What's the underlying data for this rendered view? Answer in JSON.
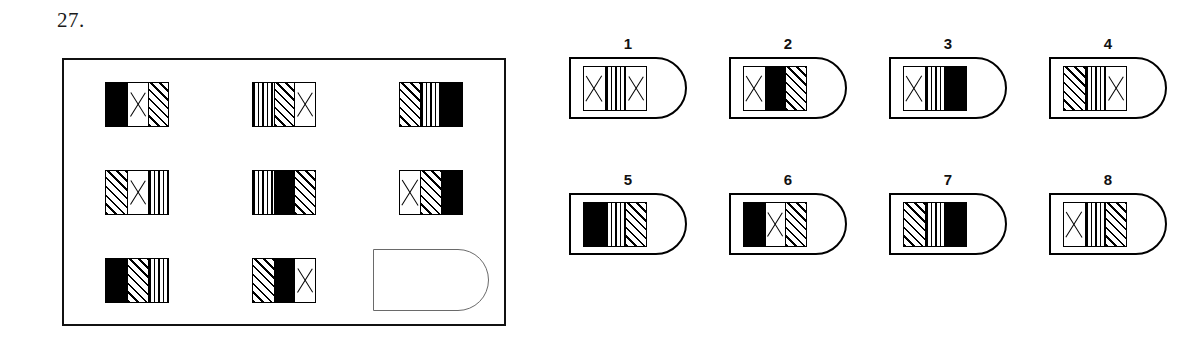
{
  "question": {
    "number": "27."
  },
  "matrix": {
    "name": "matrix-panel",
    "rows": 3,
    "cols": 3,
    "cells": [
      {
        "position": "row1-col1",
        "bands": [
          "black",
          "cross",
          "diagonal"
        ],
        "empty": false
      },
      {
        "position": "row1-col2",
        "bands": [
          "vertical",
          "diagonal",
          "cross"
        ],
        "empty": false
      },
      {
        "position": "row1-col3",
        "bands": [
          "diagonal",
          "vertical",
          "black"
        ],
        "empty": false
      },
      {
        "position": "row2-col1",
        "bands": [
          "diagonal",
          "cross",
          "vertical"
        ],
        "empty": false
      },
      {
        "position": "row2-col2",
        "bands": [
          "vertical",
          "black",
          "diagonal"
        ],
        "empty": false
      },
      {
        "position": "row2-col3",
        "bands": [
          "cross",
          "diagonal",
          "black"
        ],
        "empty": false
      },
      {
        "position": "row3-col1",
        "bands": [
          "black",
          "diagonal",
          "vertical"
        ],
        "empty": false
      },
      {
        "position": "row3-col2",
        "bands": [
          "diagonal",
          "black",
          "cross"
        ],
        "empty": false
      },
      {
        "position": "row3-col3",
        "bands": [],
        "empty": true
      }
    ]
  },
  "options": [
    {
      "label": "1",
      "bands": [
        "cross",
        "vertical",
        "cross"
      ]
    },
    {
      "label": "2",
      "bands": [
        "cross",
        "black",
        "diagonal"
      ]
    },
    {
      "label": "3",
      "bands": [
        "cross",
        "vertical",
        "black"
      ]
    },
    {
      "label": "4",
      "bands": [
        "diagonal",
        "vertical",
        "cross"
      ]
    },
    {
      "label": "5",
      "bands": [
        "black",
        "vertical",
        "diagonal"
      ]
    },
    {
      "label": "6",
      "bands": [
        "black",
        "cross",
        "diagonal"
      ]
    },
    {
      "label": "7",
      "bands": [
        "diagonal",
        "vertical",
        "black"
      ]
    },
    {
      "label": "8",
      "bands": [
        "cross",
        "vertical",
        "diagonal"
      ]
    }
  ],
  "colors": {
    "ink": "#000000",
    "paper": "#ffffff",
    "empty_slot_outline": "#6a6a6a"
  }
}
